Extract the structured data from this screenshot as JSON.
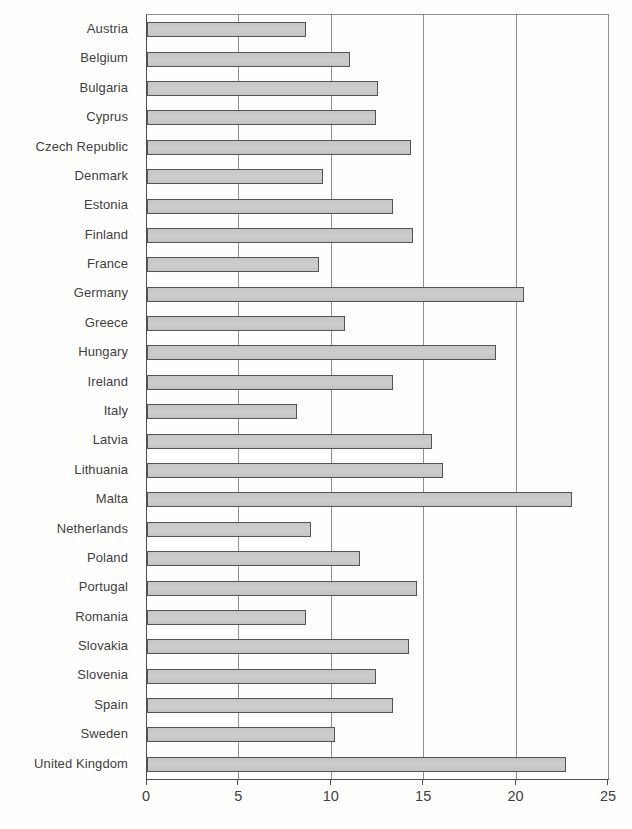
{
  "chart_data": {
    "type": "bar",
    "orientation": "horizontal",
    "title": "",
    "xlabel": "",
    "ylabel": "",
    "categories": [
      "Austria",
      "Belgium",
      "Bulgaria",
      "Cyprus",
      "Czech Republic",
      "Denmark",
      "Estonia",
      "Finland",
      "France",
      "Germany",
      "Greece",
      "Hungary",
      "Ireland",
      "Italy",
      "Latvia",
      "Lithuania",
      "Malta",
      "Netherlands",
      "Poland",
      "Portugal",
      "Romania",
      "Slovakia",
      "Slovenia",
      "Spain",
      "Sweden",
      "United Kingdom"
    ],
    "values": [
      8.6,
      11.0,
      12.5,
      12.4,
      14.3,
      9.5,
      13.3,
      14.4,
      9.3,
      20.4,
      10.7,
      18.9,
      13.3,
      8.1,
      15.4,
      16.0,
      23.0,
      8.9,
      11.5,
      14.6,
      8.6,
      14.2,
      12.4,
      13.3,
      10.2,
      22.7
    ],
    "xlim": [
      0,
      25
    ],
    "xticks": [
      0,
      5,
      10,
      15,
      20,
      25
    ],
    "grid": "vertical-gridlines-on",
    "legend": "none",
    "colors": {
      "bar_fill": "#c9c9c9",
      "bar_border": "#545454",
      "gridline": "#8f8f8f",
      "axis": "#4e4e4e",
      "text": "#3f3f3f",
      "background": "#fefefd"
    }
  }
}
